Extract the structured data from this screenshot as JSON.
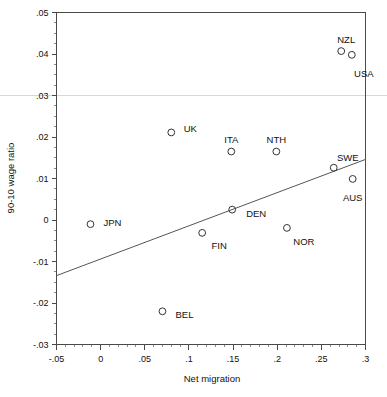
{
  "chart_data": {
    "type": "scatter",
    "title": "",
    "xlabel": "Net migration",
    "ylabel": "90-10 wage ratio",
    "xlim": [
      -0.05,
      0.3
    ],
    "ylim": [
      -0.03,
      0.05
    ],
    "grid": false,
    "legend_position": "none",
    "xticks": [
      -0.05,
      0,
      0.05,
      0.1,
      0.15,
      0.2,
      0.25,
      0.3
    ],
    "xticklabels": [
      "-.05",
      "0",
      ".05",
      ".1",
      ".15",
      ".2",
      ".25",
      ".3"
    ],
    "yticks": [
      -0.03,
      -0.02,
      -0.01,
      0,
      0.01,
      0.02,
      0.03,
      0.04,
      0.05
    ],
    "yticklabels": [
      "-.03",
      "-.02",
      "-.01",
      "0",
      ".01",
      ".02",
      ".03",
      ".04",
      ".05"
    ],
    "x_minor_interval": 0.01,
    "y_minor_interval": 0.0025,
    "marker_style": "open-circle",
    "marker_color": "#333333",
    "points": [
      {
        "label": "JPN",
        "x": -0.0115,
        "y": -0.001,
        "label_dx": 22,
        "label_dy": -1
      },
      {
        "label": "BEL",
        "x": 0.07,
        "y": -0.022,
        "label_dx": 22,
        "label_dy": 3
      },
      {
        "label": "UK",
        "x": 0.08,
        "y": 0.0211,
        "label_dx": 19,
        "label_dy": -4
      },
      {
        "label": "FIN",
        "x": 0.115,
        "y": -0.0031,
        "label_dx": 17,
        "label_dy": 13
      },
      {
        "label": "ITA",
        "x": 0.148,
        "y": 0.0165,
        "label_dx": 0,
        "label_dy": -12
      },
      {
        "label": "DEN",
        "x": 0.149,
        "y": 0.0025,
        "label_dx": 24,
        "label_dy": 4
      },
      {
        "label": "NTH",
        "x": 0.199,
        "y": 0.0165,
        "label_dx": 0,
        "label_dy": -12
      },
      {
        "label": "NOR",
        "x": 0.211,
        "y": -0.0019,
        "label_dx": 17,
        "label_dy": 14
      },
      {
        "label": "SWE",
        "x": 0.264,
        "y": 0.0126,
        "label_dx": 14,
        "label_dy": -10
      },
      {
        "label": "NZL",
        "x": 0.2725,
        "y": 0.0407,
        "label_dx": 5,
        "label_dy": -11
      },
      {
        "label": "USA",
        "x": 0.2845,
        "y": 0.0398,
        "label_dx": 12,
        "label_dy": 19
      },
      {
        "label": "AUS",
        "x": 0.2855,
        "y": 0.0099,
        "label_dx": 0,
        "label_dy": 19
      }
    ],
    "fit_line": {
      "name": "fitted regression line",
      "x_start": -0.05,
      "y_start": -0.0134,
      "x_end": 0.3,
      "y_end": 0.0146
    },
    "reference_gridline": {
      "y": 0.03,
      "color": "#d8d8d8"
    }
  }
}
